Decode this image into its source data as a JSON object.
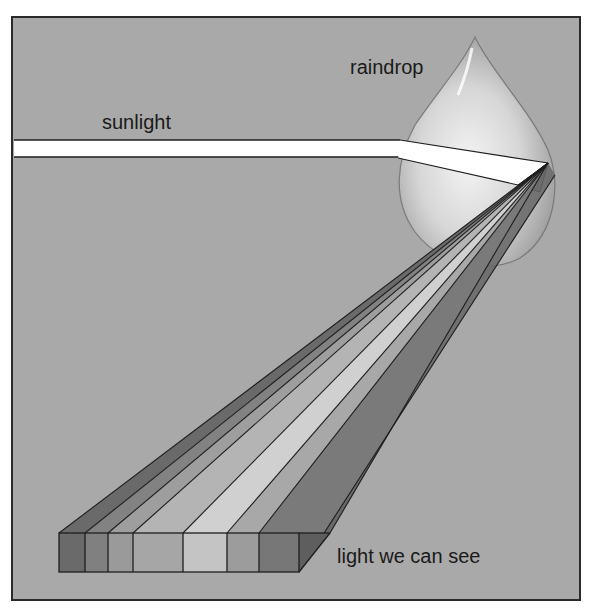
{
  "diagram": {
    "labels": {
      "sunlight": "sunlight",
      "raindrop": "raindrop",
      "visible_light": "light we can see"
    },
    "colors": {
      "background": "#ffffff",
      "panel": "#a9a9a9",
      "frame": "#2a2a2a",
      "beam": "#ffffff",
      "outline": "#1e1e1e"
    },
    "spectrum_bands": [
      {
        "index": 1,
        "shade": "#6a6a6a"
      },
      {
        "index": 2,
        "shade": "#808080"
      },
      {
        "index": 3,
        "shade": "#9a9a9a"
      },
      {
        "index": 4,
        "shade": "#a6a6a6"
      },
      {
        "index": 5,
        "shade": "#c4c4c4"
      },
      {
        "index": 6,
        "shade": "#9c9c9c"
      },
      {
        "index": 7,
        "shade": "#777777"
      }
    ]
  }
}
